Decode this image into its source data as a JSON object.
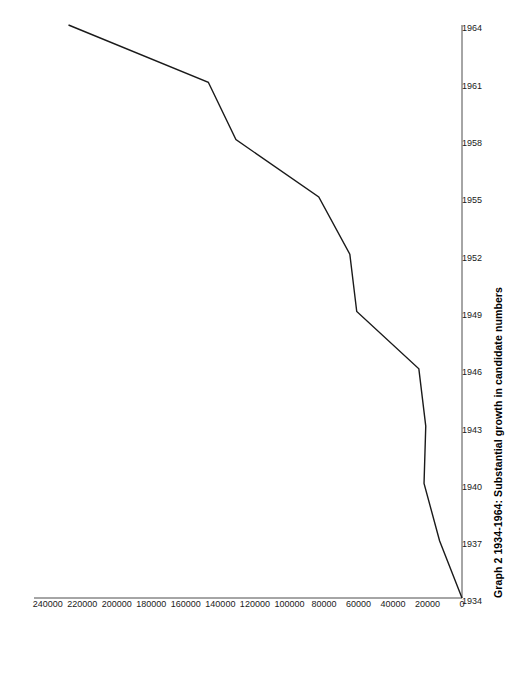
{
  "chart_data": {
    "type": "line",
    "title": "Graph 2 1934-1964: Substantial growth in candidate numbers",
    "xlabel": "",
    "ylabel": "",
    "orientation": "rotated-90",
    "grid": false,
    "legend": "none",
    "line_color": "#1a1a1a",
    "axis_color": "#4d4d4d",
    "x": [
      1934,
      1937,
      1940,
      1943,
      1946,
      1949,
      1952,
      1955,
      1958,
      1961,
      1964
    ],
    "xtick_labels": [
      "1934",
      "1937",
      "1940",
      "1943",
      "1946",
      "1949",
      "1952",
      "1955",
      "1958",
      "1961",
      "1964"
    ],
    "xlim": [
      1934,
      1964
    ],
    "values": [
      0,
      13000,
      22000,
      21000,
      25000,
      61000,
      65000,
      83000,
      131000,
      147000,
      228000
    ],
    "ytick_labels": [
      "0",
      "20000",
      "40000",
      "60000",
      "80000",
      "100000",
      "120000",
      "140000",
      "160000",
      "180000",
      "200000",
      "220000",
      "240000"
    ],
    "yticks": [
      0,
      20000,
      40000,
      60000,
      80000,
      100000,
      120000,
      140000,
      160000,
      180000,
      200000,
      220000,
      240000
    ],
    "ylim": [
      0,
      248000
    ],
    "series": [
      {
        "name": "candidate numbers",
        "values": [
          0,
          13000,
          22000,
          21000,
          25000,
          61000,
          65000,
          83000,
          131000,
          147000,
          228000
        ]
      }
    ]
  }
}
